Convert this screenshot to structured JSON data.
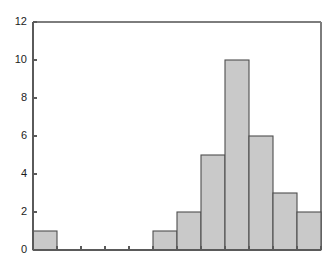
{
  "chart_data": {
    "type": "bar",
    "title": "",
    "subtitle": "",
    "xlabel": "",
    "ylabel": "",
    "categories": [
      "0",
      "1",
      "2",
      "3",
      "4",
      "5",
      "6",
      "7",
      "8",
      "9",
      "10",
      "11"
    ],
    "values": [
      1,
      0,
      0,
      0,
      0,
      1,
      2,
      5,
      10,
      6,
      3,
      2
    ],
    "ylim": [
      0,
      12
    ],
    "xlim": [
      0,
      12
    ],
    "y_ticks": [
      0,
      2,
      4,
      6,
      8,
      10,
      12
    ],
    "y_tick_labels": [
      "0",
      "2",
      "4",
      "6",
      "8",
      "10",
      "12"
    ],
    "x_ticks": [
      0,
      1,
      2,
      3,
      4,
      5,
      6,
      7,
      8,
      9,
      10,
      11,
      12
    ],
    "x_tick_labels": [
      "",
      "",
      "",
      "",
      "",
      "",
      "",
      "",
      "",
      "",
      "",
      "",
      ""
    ],
    "grid": false,
    "legend": [],
    "legend_position": "none",
    "bar_fill_color": "#c9c9c9",
    "bar_edge_color": "#4e4e4e",
    "axis_color": "#5a5a5a",
    "frame_color": "#7d7d7d",
    "background_color": "#ffffff",
    "bar_gap": 0,
    "annotations": []
  },
  "plot": {
    "left": 33,
    "right": 321,
    "top": 22,
    "bottom": 250
  }
}
